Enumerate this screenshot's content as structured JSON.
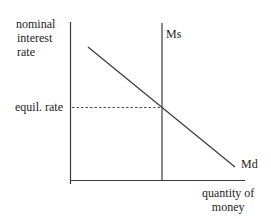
{
  "diagram": {
    "type": "money-market-supply-demand",
    "y_axis_label": [
      "nominal",
      "interest",
      "rate"
    ],
    "x_axis_label": [
      "quantity of",
      "money"
    ],
    "equilibrium_label": "equil. rate",
    "curves": [
      {
        "name": "Ms",
        "label": "Ms",
        "kind": "vertical-supply"
      },
      {
        "name": "Md",
        "label": "Md",
        "kind": "downward-sloping-demand"
      }
    ],
    "colors": {
      "line": "#3a3a3a",
      "text": "#1c1c1c",
      "background": "#ffffff"
    }
  }
}
